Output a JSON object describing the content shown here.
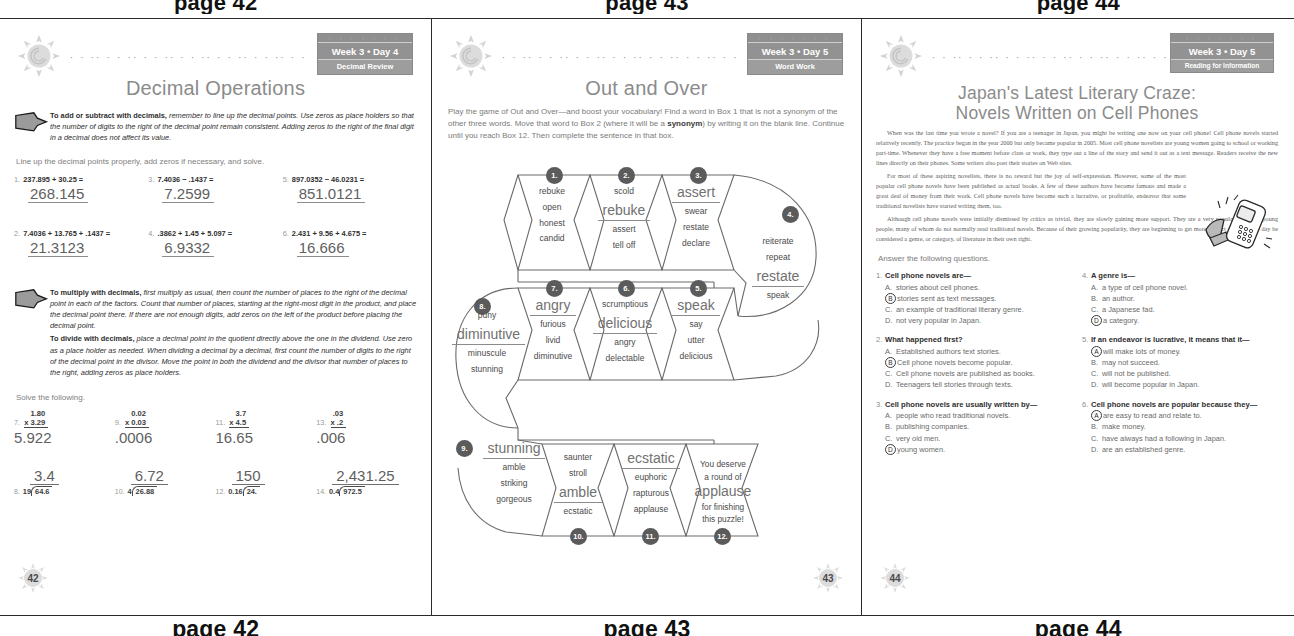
{
  "top_captions": [
    "page 42",
    "page 43",
    "page 44"
  ],
  "bottom_captions": [
    "page 42",
    "page 43",
    "page 44"
  ],
  "page42": {
    "badge": {
      "line1": "Week 3 • Day 4",
      "line2": "Decimal Review"
    },
    "title": "Decimal Operations",
    "tip1": {
      "lead": "To add or subtract with decimals,",
      "rest": " remember to line up the decimal points. Use zeros as place holders so that the number of digits to the right of the decimal point remain consistent. Adding zeros to the right of the final digit in a decimal does not affect its value."
    },
    "instruction1": "Line up the decimal points properly, add zeros if necessary, and solve.",
    "addsub": [
      {
        "n": "1.",
        "expr": "237.895 + 30.25 =",
        "answer": "268.145"
      },
      {
        "n": "2.",
        "expr": "7.4036 + 13.765 + .1437 =",
        "answer": "21.3123"
      },
      {
        "n": "3.",
        "expr": "7.4036 − .1437 =",
        "answer": "7.2599"
      },
      {
        "n": "4.",
        "expr": ".3862 + 1.45 + 5.097 =",
        "answer": "6.9332"
      },
      {
        "n": "5.",
        "expr": "897.0352 − 46.0231 =",
        "answer": "851.0121"
      },
      {
        "n": "6.",
        "expr": "2.431 + 9.56 + 4.675 =",
        "answer": "16.666"
      }
    ],
    "tip2": {
      "lead1": "To multiply with decimals,",
      "rest1": " first multiply as usual, then count the number of places to the right of the decimal point in each of the factors. Count that number of places, starting at the right-most digit in the product, and place the decimal point there. If there are not enough digits, add zeros on the left of the product before placing the decimal point.",
      "lead2": "To divide with decimals,",
      "rest2": " place a decimal point in the quotient directly above the one in the dividend. Use zero as a place holder as needed. When dividing a decimal by a decimal, first count the number of digits to the right of the decimal point in the divisor. Move the point in both the dividend and the divisor that number of places to the right, adding zeros as place holders."
    },
    "instruction2": "Solve the following.",
    "multiply": [
      {
        "n": "7.",
        "top": "1.80",
        "bottom": "x 3.29",
        "answer": "5.922"
      },
      {
        "n": "9.",
        "top": "0.02",
        "bottom": "x 0.03",
        "answer": ".0006"
      },
      {
        "n": "11.",
        "top": "3.7",
        "bottom": "x 4.5",
        "answer": "16.65"
      },
      {
        "n": "13.",
        "top": ".03",
        "bottom": "x .2",
        "answer": ".006"
      }
    ],
    "divide": [
      {
        "n": "8.",
        "divisor": "19",
        "dividend": "64.6",
        "quotient": "3.4"
      },
      {
        "n": "10.",
        "divisor": "4",
        "dividend": "26.88",
        "quotient": "6.72"
      },
      {
        "n": "12.",
        "divisor": "0.16",
        "dividend": "24.",
        "quotient": "150"
      },
      {
        "n": "14.",
        "divisor": "0.4",
        "dividend": "972.5",
        "quotient": "2,431.25"
      }
    ],
    "page_number": "42"
  },
  "page43": {
    "badge": {
      "line1": "Week 3 • Day 5",
      "line2": "Word Work"
    },
    "title": "Out and Over",
    "intro_a": "Play the game of Out and Over—and boost your vocabulary! Find a word in Box 1 that is not a synonym of the other three words. Move that word to Box 2 (where it will be a ",
    "intro_bold": "synonym",
    "intro_b": ") by writing it on the blank line. Continue until you reach Box 12. Then complete the sentence in that box.",
    "boxes": [
      {
        "num": "1.",
        "blank": "",
        "words": [
          "rebuke",
          "open",
          "honest",
          "candid"
        ]
      },
      {
        "num": "2.",
        "blank": "rebuke",
        "words": [
          "scold",
          "assert",
          "tell off"
        ]
      },
      {
        "num": "3.",
        "blank": "assert",
        "words": [
          "swear",
          "restate",
          "declare"
        ]
      },
      {
        "num": "4.",
        "blank": "restate",
        "words": [
          "reiterate",
          "repeat",
          "speak"
        ]
      },
      {
        "num": "5.",
        "blank": "speak",
        "words": [
          "say",
          "utter",
          "delicious"
        ]
      },
      {
        "num": "6.",
        "blank": "delicious",
        "words": [
          "scrumptious",
          "angry",
          "delectable"
        ]
      },
      {
        "num": "7.",
        "blank": "angry",
        "words": [
          "furious",
          "livid",
          "diminutive"
        ]
      },
      {
        "num": "8.",
        "blank": "diminutive",
        "words": [
          "puny",
          "minuscule",
          "stunning"
        ]
      },
      {
        "num": "9.",
        "blank": "stunning",
        "words": [
          "amble",
          "striking",
          "gorgeous"
        ]
      },
      {
        "num": "10.",
        "blank": "amble",
        "words": [
          "saunter",
          "stroll",
          "ecstatic"
        ]
      },
      {
        "num": "11.",
        "blank": "ecstatic",
        "words": [
          "euphoric",
          "rapturous",
          "applause"
        ]
      },
      {
        "num": "12.",
        "blank": "applause",
        "words": []
      }
    ],
    "final_line1": "You deserve",
    "final_line2": "a round of",
    "final_big": "applause",
    "final_line3": "for finishing",
    "final_line4": "this puzzle!",
    "page_number": "43"
  },
  "page44": {
    "badge": {
      "line1": "Week 3 • Day 5",
      "line2": "Reading for Information"
    },
    "title_line1": "Japan's Latest Literary Craze:",
    "title_line2": "Novels Written on Cell Phones",
    "article": [
      "When was the last time you wrote a novel? If you are a teenager in Japan, you might be writing one now on your cell phone! Cell phone novels started relatively recently. The practice began in the year 2000 but only became popular in 2005. Most cell phone novelists are young women going to school or working part-time. Whenever they have a free moment before class or work, they type out a line of the story and send it out as a text message. Readers receive the new lines directly on their phones. Some writers also post their stories on Web sites.",
      "For most of these aspiring novelists, there is no reward but the joy of self-expression. However, some of the most popular cell phone novels have been published as actual books. A few of these authors have become famous and made a great deal of money from their work. Cell phone novels have become such a lucrative, or profitable, endeavor that some traditional novelists have started writing them, too.",
      "Although cell phone novels were initially dismissed by critics as trivial, they are slowly gaining more support. They are a very popular genre for young people, many of whom do not normally read traditional novels. Because of their growing popularity, they are beginning to get more respect and may one day be considered a genre, or category, of literature in their own right."
    ],
    "questions_intro": "Answer the following questions.",
    "questions": [
      {
        "n": "1.",
        "stem": "Cell phone novels are—",
        "options": [
          {
            "letter": "A.",
            "text": "stories about cell phones.",
            "selected": false
          },
          {
            "letter": "B",
            "text": "stories sent as text messages.",
            "selected": true
          },
          {
            "letter": "C.",
            "text": "an example of traditional literary genre.",
            "selected": false
          },
          {
            "letter": "D.",
            "text": "not very popular in Japan.",
            "selected": false
          }
        ]
      },
      {
        "n": "2.",
        "stem": "What happened first?",
        "options": [
          {
            "letter": "A.",
            "text": "Established authors text stories.",
            "selected": false
          },
          {
            "letter": "B",
            "text": "Cell phone novels become popular.",
            "selected": true
          },
          {
            "letter": "C.",
            "text": "Cell phone novels are published as books.",
            "selected": false
          },
          {
            "letter": "D.",
            "text": "Teenagers tell stories through texts.",
            "selected": false
          }
        ]
      },
      {
        "n": "3.",
        "stem": "Cell phone novels are usually written by—",
        "options": [
          {
            "letter": "A.",
            "text": "people who read traditional novels.",
            "selected": false
          },
          {
            "letter": "B.",
            "text": "publishing companies.",
            "selected": false
          },
          {
            "letter": "C.",
            "text": "very old men.",
            "selected": false
          },
          {
            "letter": "D",
            "text": "young women.",
            "selected": true
          }
        ]
      },
      {
        "n": "4.",
        "stem": "A genre is—",
        "options": [
          {
            "letter": "A.",
            "text": "a type of cell phone novel.",
            "selected": false
          },
          {
            "letter": "B.",
            "text": "an author.",
            "selected": false
          },
          {
            "letter": "C.",
            "text": "a Japanese fad.",
            "selected": false
          },
          {
            "letter": "D",
            "text": "a category.",
            "selected": true
          }
        ]
      },
      {
        "n": "5.",
        "stem": "If an endeavor is lucrative, it means that it—",
        "options": [
          {
            "letter": "A",
            "text": "will make lots of money.",
            "selected": true
          },
          {
            "letter": "B.",
            "text": "may not succeed.",
            "selected": false
          },
          {
            "letter": "C.",
            "text": "will not be published.",
            "selected": false
          },
          {
            "letter": "D.",
            "text": "will become popular in Japan.",
            "selected": false
          }
        ]
      },
      {
        "n": "6.",
        "stem": "Cell phone novels are popular because they—",
        "options": [
          {
            "letter": "A",
            "text": "are easy to read and relate to.",
            "selected": true
          },
          {
            "letter": "B.",
            "text": "make money.",
            "selected": false
          },
          {
            "letter": "C.",
            "text": "have always had a following in Japan.",
            "selected": false
          },
          {
            "letter": "D.",
            "text": "are an established genre.",
            "selected": false
          }
        ]
      }
    ],
    "page_number": "44"
  },
  "colors": {
    "title": "#8b8b8b",
    "answer": "#5f5f5f",
    "badge": "#9a9a9a",
    "rule": "#2b2b2b"
  }
}
